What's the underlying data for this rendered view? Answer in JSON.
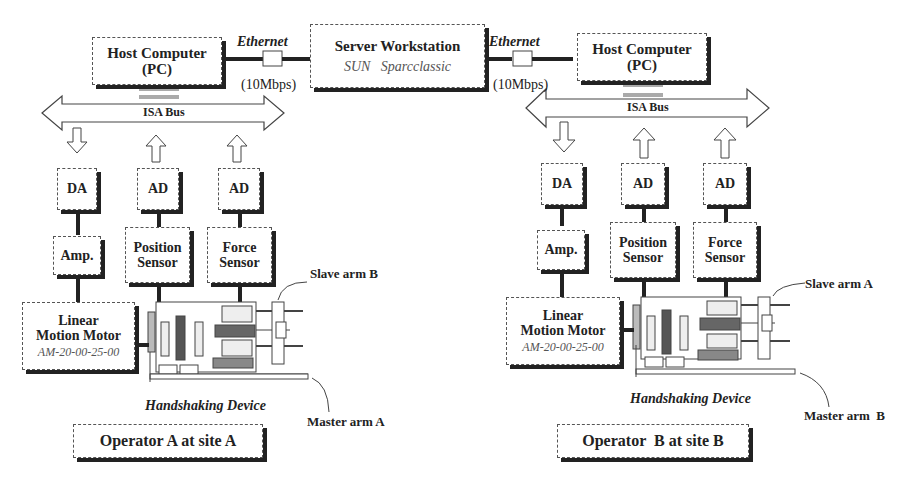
{
  "network": {
    "server": {
      "title": "Server Workstation",
      "subtitle": "SUN   Sparcclassic"
    },
    "link_left": {
      "protocol": "Ethernet",
      "speed": "(10Mbps)"
    },
    "link_right": {
      "protocol": "Ethernet",
      "speed": "(10Mbps)"
    }
  },
  "site_a": {
    "host": {
      "line1": "Host Computer",
      "line2": "(PC)"
    },
    "bus": "ISA Bus",
    "da": "DA",
    "ad_position": "AD",
    "ad_force": "AD",
    "amp": "Amp.",
    "position_sensor": {
      "line1": "Position",
      "line2": "Sensor"
    },
    "force_sensor": {
      "line1": "Force",
      "line2": "Sensor"
    },
    "motor": {
      "line1": "Linear",
      "line2": "Motion Motor",
      "model": "AM-20-00-25-00"
    },
    "slave_arm": "Slave arm B",
    "master_arm": "Master arm A",
    "device": "Handshaking Device",
    "operator": "Operator A at site A"
  },
  "site_b": {
    "host": {
      "line1": "Host Computer",
      "line2": "(PC)"
    },
    "bus": "ISA Bus",
    "da": "DA",
    "ad_position": "AD",
    "ad_force": "AD",
    "amp": "Amp.",
    "position_sensor": {
      "line1": "Position",
      "line2": "Sensor"
    },
    "force_sensor": {
      "line1": "Force",
      "line2": "Sensor"
    },
    "motor": {
      "line1": "Linear",
      "line2": "Motion Motor",
      "model": "AM-20-00-25-00"
    },
    "slave_arm": "Slave arm A",
    "master_arm": "Master arm  B",
    "device": "Handshaking Device",
    "operator": "Operator  B at site B"
  }
}
